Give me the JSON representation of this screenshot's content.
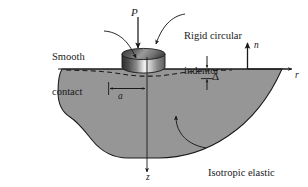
{
  "figure": {
    "labels": {
      "rigid_indentor_line1": "Rigid circular",
      "rigid_indentor_line2": "indentor",
      "smooth_contact_line1": "Smooth",
      "smooth_contact_line2": "contact",
      "isotropic_line1": "Isotropic elastic",
      "isotropic_line2": "halfspace (μ,ν)",
      "load": "P",
      "normal_axis": "n",
      "radial_axis": "r",
      "depth_axis": "z",
      "contact_radius": "a",
      "indentation_depth": "Δ"
    },
    "colors": {
      "halfspace_fill": "#969696",
      "halfspace_stroke": "#1a1a1a",
      "indentor_dark": "#3d3d3d",
      "indentor_light": "#f2f2f2",
      "line": "#1a1a1a",
      "background": "#ffffff"
    },
    "geometry": {
      "surface_y": 69,
      "indentor_left_x": 122,
      "indentor_right_x": 165,
      "indentor_top_y": 50,
      "axis_origin_x": 147,
      "contact_radius_px": 29,
      "delta_px": 10
    }
  }
}
